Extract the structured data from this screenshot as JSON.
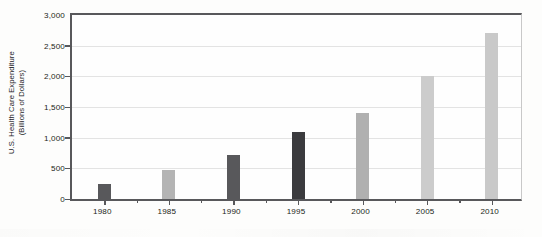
{
  "chart_data": {
    "type": "bar",
    "title": "",
    "xlabel": "",
    "ylabel_line1": "U.S. Health Care Expenditure",
    "ylabel_line2": "(Billions of Dollars)",
    "categories": [
      "1980",
      "1985",
      "1990",
      "1995",
      "2000",
      "2005",
      "2010"
    ],
    "values": [
      250,
      470,
      720,
      1100,
      1400,
      2000,
      2700
    ],
    "bar_colors": [
      "#58585b",
      "#b4b4b4",
      "#58585b",
      "#3b3b3e",
      "#b0b0b0",
      "#cccccc",
      "#c9c9c9"
    ],
    "ylim": [
      0,
      3000
    ],
    "ytick_values": [
      0,
      500,
      1000,
      1500,
      2000,
      2500,
      3000
    ],
    "ytick_labels": [
      "0",
      "500",
      "1,000",
      "1,500",
      "2,000",
      "2,500",
      "3,000"
    ],
    "grid": true,
    "legend": "none",
    "axis_color": "#58585b",
    "gridline_color": "#e3e3e3",
    "plot_background": "#fefefe"
  }
}
